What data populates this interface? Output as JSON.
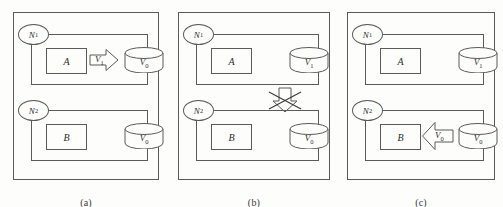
{
  "figure": {
    "background": "#fdfdfc",
    "stroke": "#5a5a56",
    "text_color": "#2e2e2c"
  },
  "panels": [
    {
      "id": "a",
      "caption": "(a)",
      "nodes": [
        {
          "id": "n1",
          "tag": "N",
          "tag_sub": "1",
          "component": "A",
          "cylinder": "V",
          "cylinder_sub": "0",
          "arrow": {
            "direction": "right",
            "label": "V",
            "label_sub": "1",
            "blocked": false
          }
        },
        {
          "id": "n2",
          "tag": "N",
          "tag_sub": "2",
          "component": "B",
          "cylinder": "V",
          "cylinder_sub": "0",
          "arrow": null
        }
      ],
      "inter_node_arrow": null
    },
    {
      "id": "b",
      "caption": "(b)",
      "nodes": [
        {
          "id": "n1",
          "tag": "N",
          "tag_sub": "1",
          "component": "A",
          "cylinder": "V",
          "cylinder_sub": "1",
          "arrow": null
        },
        {
          "id": "n2",
          "tag": "N",
          "tag_sub": "2",
          "component": "B",
          "cylinder": "V",
          "cylinder_sub": "0",
          "arrow": null
        }
      ],
      "inter_node_arrow": {
        "direction": "down",
        "blocked": true,
        "label": ""
      }
    },
    {
      "id": "c",
      "caption": "(c)",
      "nodes": [
        {
          "id": "n1",
          "tag": "N",
          "tag_sub": "1",
          "component": "A",
          "cylinder": "V",
          "cylinder_sub": "1",
          "arrow": null
        },
        {
          "id": "n2",
          "tag": "N",
          "tag_sub": "2",
          "component": "B",
          "cylinder": "V",
          "cylinder_sub": "0",
          "arrow": {
            "direction": "left",
            "label": "V",
            "label_sub": "0",
            "blocked": false
          }
        }
      ],
      "inter_node_arrow": null
    }
  ]
}
